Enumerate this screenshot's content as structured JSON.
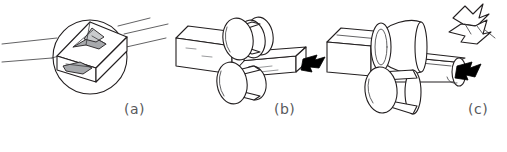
{
  "figure": {
    "background_color": "#ffffff",
    "line_color": "#231f20",
    "caption_color": "#58595b",
    "panels": [
      {
        "id": "a",
        "caption": "(a)",
        "description": "magnified circular detail view of surface cracks on a rolled square bar",
        "elements": [
          "magnifier-circle",
          "square-bar",
          "top-surface-crack",
          "side-surface-crack",
          "leader-lines"
        ]
      },
      {
        "id": "b",
        "caption": "(b)",
        "description": "square bar passing between a pair of flat rolls, exiting with a black arrow indicating rolling direction",
        "elements": [
          "square-bar-entry",
          "upper-roll",
          "lower-roll",
          "square-bar-exit",
          "direction-arrow",
          "surface-crack-marks"
        ]
      },
      {
        "id": "c",
        "caption": "(c)",
        "description": "square bar passing between concave grooved rolls, exiting deformed with a fractured fragment breaking away",
        "elements": [
          "square-bar-entry",
          "upper-concave-roll",
          "lower-roll",
          "deformed-bar-exit",
          "direction-arrow",
          "fractured-fragment"
        ]
      }
    ]
  },
  "captions": {
    "a": "(a)",
    "b": "(b)",
    "c": "(c)"
  }
}
